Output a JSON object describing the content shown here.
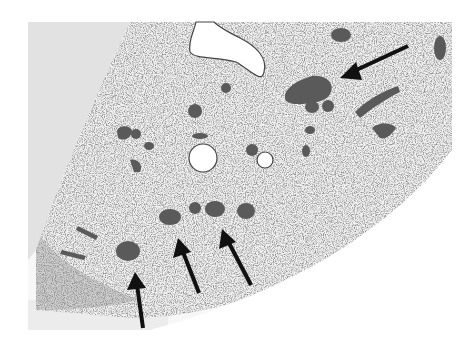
{
  "figure": {
    "type": "histology micrograph",
    "arrows": [
      {
        "id": 1,
        "tip": [
          340,
          78
        ],
        "tail": [
          408,
          46
        ]
      },
      {
        "id": 2,
        "tip": [
          135,
          272
        ],
        "tail": [
          143,
          328
        ]
      },
      {
        "id": 3,
        "tip": [
          178,
          238
        ],
        "tail": [
          199,
          293
        ]
      },
      {
        "id": 4,
        "tip": [
          222,
          229
        ],
        "tail": [
          251,
          285
        ]
      }
    ],
    "colors": {
      "background": "#ffffff",
      "photo_bg_left": "#e4e4e4",
      "tissue": "#f4f4f4",
      "stain_dark": "#5a5a5a",
      "arrow": "#111111"
    }
  }
}
